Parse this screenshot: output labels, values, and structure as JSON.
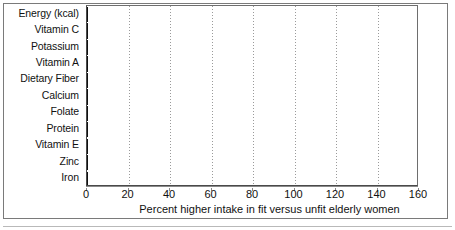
{
  "chart_data": {
    "type": "bar",
    "orientation": "horizontal",
    "title": "",
    "subtitle": "",
    "xlabel": "Percent higher intake in fit versus unfit elderly women",
    "ylabel": "",
    "xlim": [
      0,
      160
    ],
    "xticks": [
      0,
      20,
      40,
      60,
      80,
      100,
      120,
      140,
      160
    ],
    "xtick_labels": [
      "0",
      "20",
      "40",
      "60",
      "80",
      "100",
      "120",
      "140",
      "160"
    ],
    "grid": "vertical-dotted",
    "legend": "none",
    "categories": [
      "Energy (kcal)",
      "Vitamin C",
      "Potassium",
      "Vitamin A",
      "Dietary Fiber",
      "Calcium",
      "Folate",
      "Protein",
      "Vitamin E",
      "Zinc",
      "Iron"
    ],
    "values": [
      54,
      144,
      101,
      89,
      78,
      65,
      62,
      52,
      37,
      36,
      33
    ],
    "value_labels": [
      "54",
      "144",
      "101",
      "89",
      "78",
      "65",
      "62",
      "52",
      "37",
      "36",
      "33"
    ],
    "bar_shades": [
      "dark",
      "dark",
      "light",
      "dark",
      "light",
      "dark",
      "light",
      "dark",
      "light",
      "dark",
      "light"
    ],
    "colors": {
      "bar_dark": "#6b6b6b",
      "bar_light": "#b4b4b4",
      "value_label": "#ffffff",
      "axis": "#8a8a8a",
      "grid": "#9a9a9a",
      "text": "#111111",
      "frame": "#7a7a7a",
      "background": "#ffffff"
    }
  }
}
